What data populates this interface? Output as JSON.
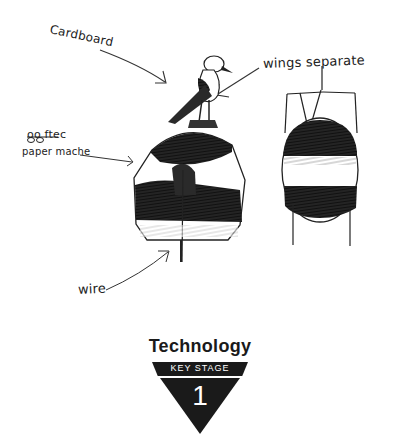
{
  "sketch": {
    "annotations": {
      "cardboard": "Cardboard",
      "wings_separate": "wings separate",
      "ooftec": "oo ftec",
      "paper_mache": "paper mache",
      "wire": "wire"
    },
    "colors": {
      "ink": "#1e1e1e",
      "paper": "#ffffff"
    }
  },
  "logo": {
    "title": "Technology",
    "band_text": "KEY STAGE",
    "stage_number": "1",
    "color": "#1a1a1a"
  }
}
